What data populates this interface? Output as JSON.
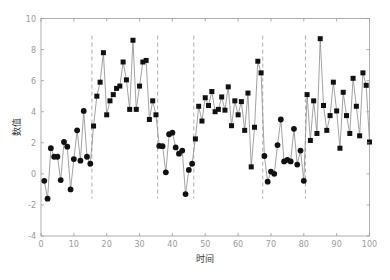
{
  "chart_data": {
    "type": "line",
    "title": "",
    "xlabel": "时间",
    "ylabel": "数值",
    "xlim": [
      0,
      100
    ],
    "ylim": [
      -4,
      10
    ],
    "xticks": [
      0,
      10,
      20,
      30,
      40,
      50,
      60,
      70,
      80,
      90,
      100
    ],
    "yticks": [
      -4,
      -2,
      0,
      2,
      4,
      6,
      8,
      10
    ],
    "grid": false,
    "legend": null,
    "change_points": [
      15.5,
      35.5,
      46.5,
      67.5,
      80.5
    ],
    "change_point_span": [
      -1.6,
      8.9
    ],
    "series": [
      {
        "name": "segment-1",
        "marker": "circle",
        "x_start": 1,
        "values": [
          -0.45,
          -1.6,
          1.65,
          1.1,
          1.1,
          -0.4,
          2.05,
          1.75,
          -1.0,
          0.95,
          2.8,
          0.85,
          4.05,
          1.1,
          0.65
        ]
      },
      {
        "name": "segment-2",
        "marker": "square",
        "x_start": 16,
        "values": [
          3.08,
          5.0,
          5.9,
          7.8,
          3.8,
          4.7,
          5.1,
          5.5,
          5.65,
          7.2,
          6.05,
          4.15,
          8.6,
          4.15,
          5.65,
          7.2,
          7.3,
          3.5,
          4.7,
          3.8
        ]
      },
      {
        "name": "segment-3",
        "marker": "circle",
        "x_start": 36,
        "values": [
          1.8,
          1.78,
          0.1,
          2.55,
          2.65,
          1.7,
          1.3,
          1.5,
          -1.3,
          0.25,
          0.65
        ]
      },
      {
        "name": "segment-4",
        "marker": "square",
        "x_start": 47,
        "values": [
          2.25,
          4.35,
          3.4,
          4.9,
          4.4,
          5.3,
          4.0,
          4.15,
          4.95,
          4.1,
          5.6,
          3.1,
          4.7,
          3.8,
          4.65,
          2.8,
          5.2,
          0.45,
          3.0,
          7.25,
          6.5
        ]
      },
      {
        "name": "segment-5",
        "marker": "circle",
        "x_start": 68,
        "values": [
          1.15,
          -0.5,
          0.15,
          0.0,
          1.85,
          3.5,
          0.8,
          0.9,
          0.8,
          2.9,
          0.6,
          1.5,
          -0.45
        ]
      },
      {
        "name": "segment-6",
        "marker": "square",
        "x_start": 81,
        "values": [
          5.1,
          2.15,
          4.7,
          2.6,
          8.7,
          4.4,
          2.8,
          3.75,
          5.9,
          4.05,
          1.65,
          5.25,
          3.75,
          2.6,
          6.15,
          4.35,
          2.45,
          6.5,
          5.7,
          2.05
        ]
      }
    ]
  },
  "colors": {
    "line": "#8a8a8a",
    "marker": "#111111",
    "axis": "#9a9a9a",
    "change_point": "#999999"
  }
}
